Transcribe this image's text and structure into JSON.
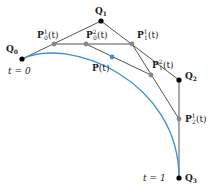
{
  "diagram": {
    "colors": {
      "curve": "#3b8fd4",
      "lines": "#555555",
      "control_point": "#000000",
      "intermediate_point": "#888888",
      "curve_point": "#3b8fd4"
    },
    "control_points": [
      {
        "id": "Q0",
        "name": "Q",
        "sub": "0",
        "x": 22,
        "y": 59
      },
      {
        "id": "Q1",
        "name": "Q",
        "sub": "1",
        "x": 101,
        "y": 21
      },
      {
        "id": "Q2",
        "name": "Q",
        "sub": "2",
        "x": 179,
        "y": 80
      },
      {
        "id": "Q3",
        "name": "Q",
        "sub": "3",
        "x": 179,
        "y": 178
      }
    ],
    "intermediate_points": [
      {
        "id": "P0_1",
        "label": "P",
        "sub": "0",
        "sup": "1",
        "arg": "(t)",
        "x": 54,
        "y": 44
      },
      {
        "id": "P1_1",
        "label": "P",
        "sub": "1",
        "sup": "1",
        "arg": "(t)",
        "x": 132,
        "y": 44
      },
      {
        "id": "P2_1",
        "label": "P",
        "sub": "2",
        "sup": "1",
        "arg": "(t)",
        "x": 179,
        "y": 119
      },
      {
        "id": "P0_2",
        "label": "P",
        "sub": "0",
        "sup": "2",
        "arg": "(t)",
        "x": 86,
        "y": 44
      },
      {
        "id": "P1_2",
        "label": "P",
        "sub": "1",
        "sup": "2",
        "arg": "(t)",
        "x": 151,
        "y": 75
      }
    ],
    "curve_point": {
      "label": "P",
      "arg": "(t)",
      "x": 112,
      "y": 57
    },
    "parameter_labels": {
      "start": "t = 0",
      "end": "t = 1"
    }
  }
}
